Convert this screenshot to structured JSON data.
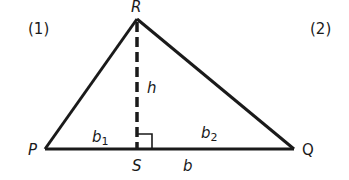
{
  "diagram": {
    "left_number": "(1)",
    "right_number": "(2)",
    "vertices": {
      "R": "R",
      "P": "P",
      "Q": "Q",
      "S": "S"
    },
    "labels": {
      "height": "h",
      "b1": "b",
      "b1_sub": "1",
      "b2": "b",
      "b2_sub": "2",
      "base": "b"
    },
    "colors": {
      "stroke": "#1a1a1a",
      "background": "#ffffff"
    }
  }
}
